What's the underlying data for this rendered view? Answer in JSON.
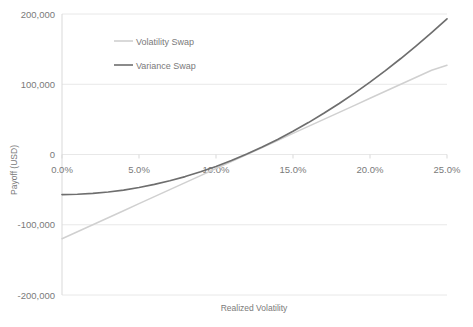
{
  "chart_data": {
    "type": "line",
    "title": "",
    "xlabel": "Realized Volatility",
    "ylabel": "Payoff (USD)",
    "xlim": [
      0,
      25
    ],
    "ylim": [
      -200000,
      200000
    ],
    "grid": true,
    "legend_position": "top-left-inside",
    "x_tick_labels": [
      "0.0%",
      "5.0%",
      "10.0%",
      "15.0%",
      "20.0%",
      "25.0%"
    ],
    "x_tick_values": [
      0,
      5,
      10,
      15,
      20,
      25
    ],
    "y_tick_labels": [
      "200,000",
      "100,000",
      "0",
      "-100,000",
      "-200,000"
    ],
    "y_tick_values": [
      200000,
      100000,
      0,
      -100000,
      -200000
    ],
    "x": [
      0,
      1,
      2,
      3,
      4,
      5,
      6,
      7,
      8,
      9,
      10,
      11,
      12,
      13,
      14,
      15,
      16,
      17,
      18,
      19,
      20,
      21,
      22,
      23,
      24,
      25
    ],
    "series": [
      {
        "name": "Volatility Swap",
        "color": "#d0d0d0",
        "values": [
          -120000,
          -110000,
          -100000,
          -90000,
          -80000,
          -70000,
          -60000,
          -50000,
          -40000,
          -30000,
          -20000,
          -10000,
          0,
          10000,
          20000,
          30000,
          40000,
          50000,
          60000,
          70000,
          80000,
          90000,
          100000,
          110000,
          120000,
          127000
        ]
      },
      {
        "name": "Variance Swap",
        "color": "#6e6e6e",
        "values": [
          -57000,
          -56600,
          -55400,
          -53400,
          -50600,
          -47000,
          -42600,
          -37400,
          -31400,
          -24600,
          -17000,
          -8600,
          600,
          10600,
          21400,
          33000,
          45400,
          58600,
          72600,
          87400,
          103000,
          119400,
          136600,
          154600,
          173400,
          193000
        ]
      }
    ]
  },
  "legend": {
    "entries": [
      {
        "label": "Volatility Swap"
      },
      {
        "label": "Variance Swap"
      }
    ]
  },
  "axes": {
    "x_title": "Realized Volatility",
    "y_title": "Payoff (USD)"
  },
  "colors": {
    "volatility_swap": "#d0d0d0",
    "variance_swap": "#6e6e6e",
    "gridline": "#e8e8e8",
    "axis_line": "#d9d9d9",
    "text": "#7a7a7a",
    "background": "#ffffff"
  }
}
